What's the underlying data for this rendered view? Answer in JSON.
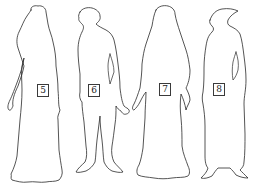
{
  "figures": [
    {
      "id": "figure-5",
      "label": "5",
      "description": "long-robed figure with hood/veil, arms at sides",
      "label_pos": {
        "x": 37,
        "y": 84
      }
    },
    {
      "id": "figure-6",
      "label": "6",
      "description": "man in short tunic and hose with hooded cap, hand extended",
      "label_pos": {
        "x": 88,
        "y": 84
      }
    },
    {
      "id": "figure-7",
      "label": "7",
      "description": "woman in long gown with long hair, holding hands",
      "label_pos": {
        "x": 159,
        "y": 83
      }
    },
    {
      "id": "figure-8",
      "label": "8",
      "description": "figure in long coat with peaked hat, pointed shoes",
      "label_pos": {
        "x": 213,
        "y": 83
      }
    }
  ],
  "colors": {
    "stroke": "#2a2a2a",
    "background": "#ffffff"
  }
}
